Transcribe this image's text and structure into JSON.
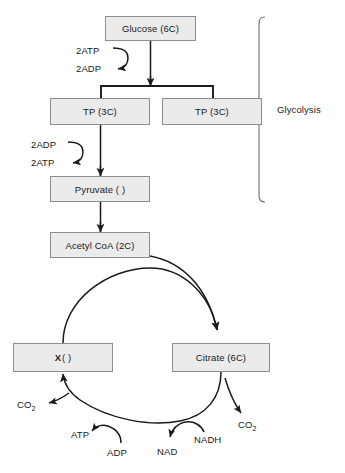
{
  "diagram": {
    "colors": {
      "box_fill": "#ebebeb",
      "box_border": "#8d8d8d",
      "stroke": "#1a1a1a",
      "text": "#1a1a1a",
      "background": "#ffffff"
    }
  },
  "glycolysis": {
    "bracket_label": "Glycolysis",
    "nodes": {
      "glucose": "Glucose (6C)",
      "tp_left": "TP (3C)",
      "tp_right": "TP (3C)",
      "pyruvate": "Pyruvate (  )"
    },
    "cofactors": {
      "atp_in": "2ATP",
      "adp_out": "2ADP",
      "adp_in": "2ADP",
      "atp_out": "2ATP"
    }
  },
  "krebs": {
    "nodes": {
      "acetyl_coa": "Acetyl CoA (2C)",
      "citrate": "Citrate (6C)",
      "x_bold": "X",
      "x_brackets": "(   )"
    },
    "byproducts": {
      "co2_left": "CO",
      "co2_left_sub": "2",
      "atp": "ATP",
      "adp": "ADP",
      "nad": "NAD",
      "nadh": "NADH",
      "co2_right": "CO",
      "co2_right_sub": "2"
    }
  }
}
